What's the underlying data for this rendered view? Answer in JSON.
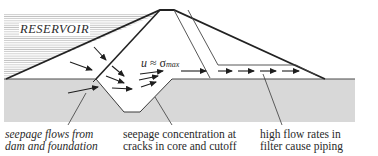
{
  "diagram": {
    "type": "embankment dam seepage cross-section",
    "reservoir_label": "RESERVOIR",
    "equation": {
      "lhs": "u",
      "op": "≈",
      "rhs": "σ",
      "subscript": "max"
    },
    "annotations": [
      {
        "id": "seepage-flows",
        "lines": [
          "seepage flows from",
          "dam and foundation"
        ],
        "style": "italic"
      },
      {
        "id": "seepage-concentration",
        "lines": [
          "seepage concentration at",
          "cracks in core and cutoff"
        ],
        "style": "normal"
      },
      {
        "id": "high-flow-rates",
        "lines": [
          "high flow rates in",
          "filter cause piping"
        ],
        "style": "normal"
      }
    ],
    "regions": [
      "reservoir",
      "dam-shell",
      "core",
      "cutoff-trench",
      "filter-drain",
      "foundation"
    ],
    "colors": {
      "foundation": "#d8d8d8",
      "line": "#2b2b2b",
      "reservoir_hatch": "#9a9a9a",
      "background": "#ffffff"
    }
  }
}
